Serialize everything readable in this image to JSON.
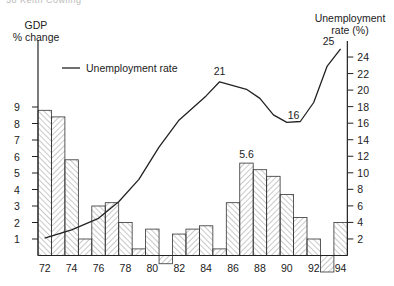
{
  "page": {
    "running_head": "58  Keith Cowling"
  },
  "chart_data": {
    "type": "bar+line",
    "title": "",
    "left_axis": {
      "label_line1": "GDP",
      "label_line2": "% change",
      "ticks": [
        1,
        2,
        3,
        4,
        5,
        6,
        7,
        8,
        9
      ],
      "range": [
        -1,
        10
      ]
    },
    "right_axis": {
      "label_line1": "Unemployment",
      "label_line2": "rate (%)",
      "ticks": [
        2,
        4,
        6,
        8,
        10,
        12,
        14,
        16,
        18,
        20,
        22,
        24
      ],
      "range": [
        0,
        26
      ]
    },
    "x_tick_labels": [
      "72",
      "74",
      "76",
      "78",
      "80",
      "82",
      "84",
      "86",
      "88",
      "90",
      "92",
      "94"
    ],
    "legend": [
      {
        "name": "Unemployment rate",
        "type": "line",
        "color": "#222222"
      }
    ],
    "categories": [
      72,
      73,
      74,
      75,
      76,
      77,
      78,
      79,
      80,
      81,
      82,
      83,
      84,
      85,
      86,
      87,
      88,
      89,
      90,
      91,
      92,
      93,
      94
    ],
    "series": [
      {
        "name": "GDP % change",
        "type": "bar",
        "axis": "left",
        "values": [
          8.8,
          8.4,
          5.8,
          1.0,
          3.0,
          3.2,
          2.0,
          0.4,
          1.6,
          -0.5,
          1.3,
          1.6,
          1.8,
          0.4,
          3.2,
          5.6,
          5.2,
          4.8,
          3.7,
          2.3,
          1.0,
          -1.0,
          2.0
        ]
      },
      {
        "name": "Unemployment rate",
        "type": "line",
        "axis": "right",
        "x": [
          72,
          74,
          76,
          77.5,
          79,
          80.5,
          82,
          84,
          85,
          87,
          88,
          89,
          90,
          91,
          92,
          93,
          94
        ],
        "values": [
          2.1,
          3.1,
          4.5,
          6.5,
          9.2,
          13.1,
          16.4,
          19.3,
          21,
          20.1,
          19,
          17,
          16.1,
          16.2,
          18.5,
          22.9,
          25
        ]
      }
    ],
    "annotations": [
      {
        "text": "21",
        "x": 85,
        "y": 21,
        "series": "Unemployment rate"
      },
      {
        "text": "16",
        "x": 90.5,
        "y": 16,
        "series": "Unemployment rate"
      },
      {
        "text": "25",
        "x": 94,
        "y": 25,
        "series": "Unemployment rate"
      },
      {
        "text": "5.6",
        "x": 87,
        "y": 5.6,
        "series": "GDP % change"
      }
    ],
    "grid": false,
    "legend_position": "top-left inside"
  }
}
